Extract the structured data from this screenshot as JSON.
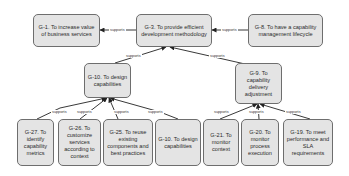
{
  "diagram": {
    "type": "goal-refinement",
    "colors": {
      "node_fill": "#e4e4e4",
      "node_border": "#6e6e6e",
      "edge": "#222222",
      "background": "#ffffff"
    },
    "nodes": [
      {
        "id": "G-1",
        "label": "G-1. To increase value of business services"
      },
      {
        "id": "G-3",
        "label": "G-3. To provide efficient development methodology"
      },
      {
        "id": "G-8",
        "label": "G-8. To have a capability management lifecycle"
      },
      {
        "id": "G-10",
        "label": "G-10. To design capabilities"
      },
      {
        "id": "G-9",
        "label": "G-9. To capability delivery adjustment"
      },
      {
        "id": "G-27",
        "label": "G-27. To identify capability metrics"
      },
      {
        "id": "G-26",
        "label": "G-26. To customize services according to context"
      },
      {
        "id": "G-25",
        "label": "G-25. To reuse existing components and best practices"
      },
      {
        "id": "G-10b",
        "label": "G-10. To design capabilities"
      },
      {
        "id": "G-21",
        "label": "G-21. To monitor context"
      },
      {
        "id": "G-20",
        "label": "G-20. To monitor process execution"
      },
      {
        "id": "G-19",
        "label": "G-19. To meet performance and SLA requirements"
      }
    ],
    "edges": [
      {
        "from": "G-3",
        "to": "G-1",
        "label": "supports"
      },
      {
        "from": "G-8",
        "to": "G-3",
        "label": "supports"
      },
      {
        "from": "G-10",
        "to": "G-3",
        "label": "supports"
      },
      {
        "from": "G-9",
        "to": "G-3",
        "label": "supports"
      },
      {
        "from": "G-27",
        "to": "G-10",
        "label": "supports"
      },
      {
        "from": "G-26",
        "to": "G-10",
        "label": "supports"
      },
      {
        "from": "G-25",
        "to": "G-10",
        "label": "supports"
      },
      {
        "from": "G-10b",
        "to": "G-10",
        "label": "supports"
      },
      {
        "from": "G-21",
        "to": "G-9",
        "label": "supports"
      },
      {
        "from": "G-20",
        "to": "G-9",
        "label": "supports"
      },
      {
        "from": "G-19",
        "to": "G-9",
        "label": "supports"
      }
    ]
  }
}
